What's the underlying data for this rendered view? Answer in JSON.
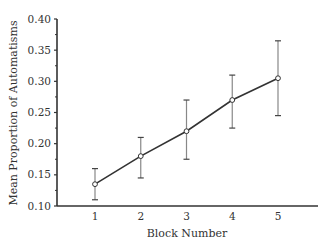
{
  "chart_data": {
    "type": "line",
    "title": "",
    "xlabel": "Block Number",
    "ylabel": "Mean Proportion of Automatisms",
    "x": [
      1,
      2,
      3,
      4,
      5
    ],
    "categories": [
      "1",
      "2",
      "3",
      "4",
      "5"
    ],
    "series": [
      {
        "name": "Mean Proportion of Automatisms",
        "values": [
          0.135,
          0.18,
          0.22,
          0.27,
          0.305
        ],
        "error_upper": [
          0.16,
          0.21,
          0.27,
          0.31,
          0.365
        ],
        "error_lower": [
          0.11,
          0.145,
          0.175,
          0.225,
          0.245
        ],
        "marker": "open-circle",
        "color": "#333333"
      }
    ],
    "ylim": [
      0.1,
      0.4
    ],
    "yticks": [
      "0.10",
      "0.15",
      "0.20",
      "0.25",
      "0.30",
      "0.35",
      "0.40"
    ],
    "xticks": [
      "1",
      "2",
      "3",
      "4",
      "5"
    ],
    "grid": false,
    "legend": null
  },
  "colors": {
    "axis": "#333333",
    "line": "#333333",
    "error_bar": "#888888",
    "marker_fill": "#ffffff"
  }
}
